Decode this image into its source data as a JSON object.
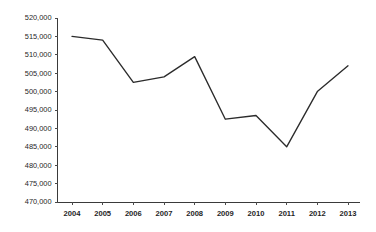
{
  "chart_data": {
    "type": "line",
    "title": "",
    "subtitle": "",
    "xlabel": "",
    "ylabel": "",
    "categories": [
      "2004",
      "2005",
      "2006",
      "2007",
      "2008",
      "2009",
      "2010",
      "2011",
      "2012",
      "2013"
    ],
    "series": [
      {
        "name": "series-1",
        "values": [
          515000,
          514000,
          502500,
          504000,
          509500,
          492500,
          493500,
          485000,
          500000,
          507000
        ]
      }
    ],
    "ylim": [
      470000,
      520000
    ],
    "ytick_values": [
      470000,
      475000,
      480000,
      485000,
      490000,
      495000,
      500000,
      505000,
      510000,
      515000,
      520000
    ],
    "ytick_labels": [
      "470,000",
      "475,000",
      "480,000",
      "485,000",
      "490,000",
      "495,000",
      "500,000",
      "505,000",
      "510,000",
      "515,000",
      "520,000"
    ],
    "xtick_labels": [
      "2004",
      "2005",
      "2006",
      "2007",
      "2008",
      "2009",
      "2010",
      "2011",
      "2012",
      "2013"
    ],
    "grid": false,
    "legend": false,
    "legend_position": "none",
    "line_color": "#2b2b2b",
    "axis_color": "#3a3a3a",
    "background_color": "#ffffff",
    "text_color": "#1f1f1f"
  }
}
